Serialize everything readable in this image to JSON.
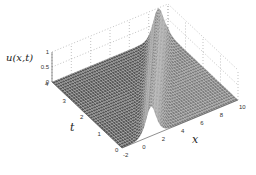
{
  "chart_data": {
    "type": "surface",
    "title": "",
    "function_description": "Traveling wave (soliton-like peak) u(x,t) moving in +x direction as t increases; peak height ~1, zero elsewhere",
    "xlabel": "x",
    "ylabel": "t",
    "zlabel": "u(x,t)",
    "xlim": [
      -2,
      10
    ],
    "ylim": [
      0,
      4
    ],
    "zlim": [
      0,
      1
    ],
    "x_ticks": [
      "-2",
      "0",
      "2",
      "4",
      "6",
      "8",
      "10"
    ],
    "t_ticks": [
      "0",
      "1",
      "2",
      "3",
      "4"
    ],
    "z_ticks": [
      "0",
      "0.5",
      "1"
    ],
    "grid": true,
    "grid_style": "dotted",
    "surface_style": "mesh, dark gray faces with light edges",
    "peak": {
      "x_at_t0": 1,
      "x_at_t4": 9,
      "height": 1,
      "speed": 2
    },
    "view": "3D oblique, x toward lower-right, t toward upper-left"
  },
  "labels": {
    "z_axis": "u(x,t)",
    "t_axis": "t",
    "x_axis": "x"
  }
}
